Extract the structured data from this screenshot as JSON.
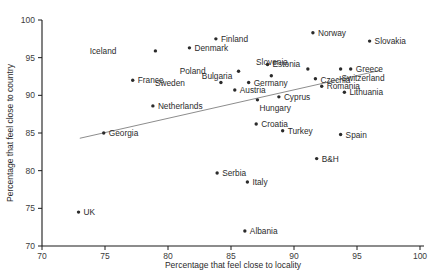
{
  "chart_data": {
    "type": "scatter",
    "title": "",
    "xlabel": "Percentage that feel close to locality",
    "ylabel": "Percentage that feel close to country",
    "xlim": [
      70,
      100
    ],
    "ylim": [
      70,
      100
    ],
    "xticks": [
      70,
      75,
      80,
      85,
      90,
      95,
      100
    ],
    "yticks": [
      70,
      75,
      80,
      85,
      90,
      95,
      100
    ],
    "grid": false,
    "legend": "none",
    "trendline": {
      "x0": 73.0,
      "y0": 84.3,
      "x1": 96.8,
      "y1": 93.3,
      "color": "#8d8d8d"
    },
    "marker_color": "#2b2b2b",
    "points": [
      {
        "label": "Norway",
        "x": 91.5,
        "y": 98.3,
        "lx": 5,
        "ly": 3
      },
      {
        "label": "Slovakia",
        "x": 96.0,
        "y": 97.2,
        "lx": 5,
        "ly": 3
      },
      {
        "label": "Finland",
        "x": 83.8,
        "y": 97.5,
        "lx": 5,
        "ly": 3
      },
      {
        "label": "Denmark",
        "x": 81.7,
        "y": 96.3,
        "lx": 5,
        "ly": 3
      },
      {
        "label": "Iceland",
        "x": 79.0,
        "y": 95.9,
        "lx": -39,
        "ly": 3
      },
      {
        "label": "Estonia",
        "x": 87.9,
        "y": 94.1,
        "lx": 5,
        "ly": 3
      },
      {
        "label": "Slovenia",
        "x": 91.1,
        "y": 93.5,
        "lx": -20,
        "ly": -4
      },
      {
        "label": "Greece",
        "x": 94.5,
        "y": 93.5,
        "lx": 5,
        "ly": 3
      },
      {
        "label": "Switzerland",
        "x": 93.7,
        "y": 93.5,
        "lx": 1,
        "ly": 12
      },
      {
        "label": "Poland",
        "x": 85.6,
        "y": 93.2,
        "lx": -33,
        "ly": 3
      },
      {
        "label": "Bulgaria",
        "x": 88.2,
        "y": 92.6,
        "lx": -39,
        "ly": 3
      },
      {
        "label": "Czechia",
        "x": 91.7,
        "y": 92.2,
        "lx": 5,
        "ly": 4
      },
      {
        "label": "France",
        "x": 77.2,
        "y": 92.0,
        "lx": 5,
        "ly": 3
      },
      {
        "label": "Sweden",
        "x": 84.2,
        "y": 91.7,
        "lx": -36,
        "ly": 3
      },
      {
        "label": "Germany",
        "x": 86.4,
        "y": 91.7,
        "lx": 5,
        "ly": 3
      },
      {
        "label": "Romania",
        "x": 92.2,
        "y": 91.2,
        "lx": 5,
        "ly": 3
      },
      {
        "label": "Austria",
        "x": 85.3,
        "y": 90.7,
        "lx": 5,
        "ly": 3
      },
      {
        "label": "Lithuania",
        "x": 94.0,
        "y": 90.4,
        "lx": 5,
        "ly": 3
      },
      {
        "label": "Cyprus",
        "x": 88.8,
        "y": 89.8,
        "lx": 5,
        "ly": 3
      },
      {
        "label": "Hungary",
        "x": 87.1,
        "y": 89.4,
        "lx": 2,
        "ly": 11
      },
      {
        "label": "Netherlands",
        "x": 78.8,
        "y": 88.6,
        "lx": 5,
        "ly": 3
      },
      {
        "label": "Croatia",
        "x": 87.0,
        "y": 86.2,
        "lx": 5,
        "ly": 3
      },
      {
        "label": "Turkey",
        "x": 89.1,
        "y": 85.3,
        "lx": 5,
        "ly": 3
      },
      {
        "label": "Spain",
        "x": 93.7,
        "y": 84.8,
        "lx": 5,
        "ly": 3
      },
      {
        "label": "Georgia",
        "x": 74.9,
        "y": 85.0,
        "lx": 5,
        "ly": 3
      },
      {
        "label": "B&H",
        "x": 91.8,
        "y": 81.6,
        "lx": 5,
        "ly": 3
      },
      {
        "label": "Serbia",
        "x": 83.9,
        "y": 79.7,
        "lx": 5,
        "ly": 3
      },
      {
        "label": "Italy",
        "x": 86.3,
        "y": 78.5,
        "lx": 5,
        "ly": 3
      },
      {
        "label": "UK",
        "x": 72.9,
        "y": 74.5,
        "lx": 5,
        "ly": 3
      },
      {
        "label": "Albania",
        "x": 86.1,
        "y": 72.0,
        "lx": 5,
        "ly": 3
      }
    ]
  }
}
